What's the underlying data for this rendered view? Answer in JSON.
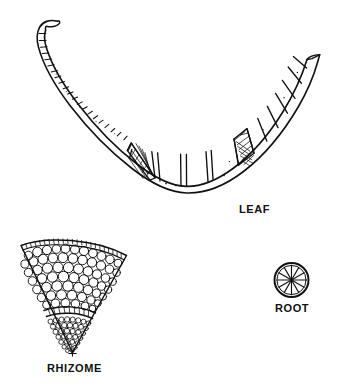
{
  "figure": {
    "background_color": "#ffffff",
    "ink_color": "#111111",
    "parts": [
      {
        "id": "leaf",
        "label": "LEAF",
        "shape": "crescent",
        "description": "Curved crescent-shaped leaf cross-section with hooked left tip, ladder-like small cells along the thin left arm, large air chambers separated by radial partitions, and two dense stippled sclerenchyma blocks along the lower margin",
        "label_position": {
          "x": 239,
          "y": 204
        }
      },
      {
        "id": "rhizome",
        "label": "RHIZOME",
        "shape": "wedge",
        "description": "Pie-slice wedge cross-section with thin epidermis arc of small rectangular cells at the top, a broad cortex of large rounded parenchyma cells, an endodermal arc boundary, and a dense inner stele of small cells narrowing to the apex",
        "label_position": {
          "x": 47,
          "y": 363
        }
      },
      {
        "id": "root",
        "label": "ROOT",
        "shape": "circle-with-radial-spokes",
        "spoke_count": 12,
        "description": "Small circular root cross-section with twelve radiating spokes and a central point",
        "label_position": {
          "x": 275,
          "y": 303
        }
      }
    ]
  },
  "labels": {
    "leaf": "LEAF",
    "rhizome": "RHIZOME",
    "root": "ROOT"
  }
}
